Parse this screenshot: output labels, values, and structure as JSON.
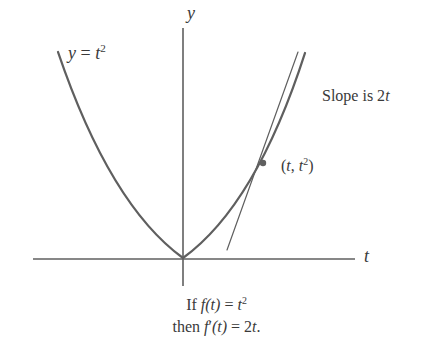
{
  "figure": {
    "background_color": "#ffffff",
    "ink_color": "#5f5f5f",
    "text_color": "#3a3a3a",
    "axes": {
      "y_label": "y",
      "t_label": "t"
    },
    "labels": {
      "curve": {
        "lhs": "y",
        "eq": " = ",
        "base": "t",
        "exp": "2"
      },
      "slope": {
        "text": "Slope is 2",
        "var": "t"
      },
      "point": {
        "open": "(",
        "var1": "t",
        "sep": ", ",
        "var2": "t",
        "exp": "2",
        "close": ")"
      }
    },
    "caption": {
      "line1": {
        "word": "If ",
        "f": "f",
        "arg": "(t)",
        "eq": " = ",
        "base": "t",
        "exp": "2"
      },
      "line2": {
        "word": "then ",
        "f": "f",
        "prime": "′",
        "arg": "(t)",
        "eq": " = 2",
        "var": "t",
        "period": "."
      }
    }
  },
  "chart_data": {
    "type": "line",
    "title": "",
    "subtitle": "",
    "xlabel": "t",
    "ylabel": "y",
    "grid": false,
    "legend": "none",
    "annotations": [
      {
        "name": "curve-label",
        "text": "y = t^2",
        "x_px": 68,
        "y_px": 44
      },
      {
        "name": "slope-label",
        "text": "Slope is 2t",
        "x_px": 322,
        "y_px": 88
      },
      {
        "name": "point-label",
        "text": "(t, t^2)",
        "x_px": 281,
        "y_px": 158
      },
      {
        "name": "caption-line-1",
        "text": "If f(t) = t^2",
        "x_px": 216,
        "y_px": 300
      },
      {
        "name": "caption-line-2",
        "text": "then f'(t) = 2t.",
        "x_px": 216,
        "y_px": 322
      }
    ],
    "series": [
      {
        "name": "y = t^2",
        "kind": "parabola",
        "equation": "y = t^2",
        "stroke": "#5f5f5f",
        "stroke_width": 2.3,
        "vertex_px": [
          183,
          258
        ],
        "left_end_px": [
          58,
          52
        ],
        "right_end_px": [
          305,
          53
        ],
        "path": "M 58 52 Q 110 205 183 258 Q 256 205 305 53"
      },
      {
        "name": "tangent line",
        "kind": "line",
        "equation": "slope = 2t at point (t, t^2)",
        "stroke": "#5f5f5f",
        "stroke_width": 1.2,
        "start_px": [
          227,
          250
        ],
        "end_px": [
          298,
          52
        ]
      }
    ],
    "markers": [
      {
        "name": "tangency-point",
        "label": "(t, t^2)",
        "x_px": 263,
        "y_px": 163,
        "r_px": 3.2,
        "fill": "#5f5f5f"
      }
    ],
    "axes_px": {
      "t_axis": {
        "x1": 33,
        "y1": 259,
        "x2": 355,
        "y2": 259,
        "stroke": "#5f5f5f"
      },
      "y_axis": {
        "x1": 183,
        "y1": 28,
        "x2": 183,
        "y2": 286,
        "stroke": "#5f5f5f"
      }
    }
  }
}
